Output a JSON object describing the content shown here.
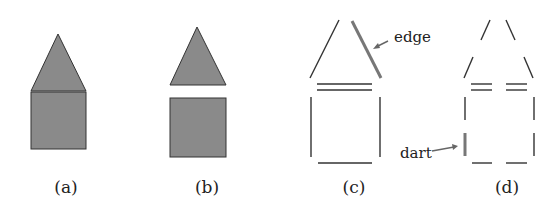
{
  "figure": {
    "panels": [
      {
        "id": "a",
        "label": "(a)",
        "description": "filled house: triangle roof on square"
      },
      {
        "id": "b",
        "label": "(b)",
        "description": "separated filled triangle and square"
      },
      {
        "id": "c",
        "label": "(c)",
        "description": "edges of the shapes",
        "annotation": "edge"
      },
      {
        "id": "d",
        "label": "(d)",
        "description": "darts (half-edges)",
        "annotation": "dart"
      }
    ],
    "colors": {
      "fill": "#8a8a8a",
      "stroke": "#333333",
      "highlight": "#777777"
    }
  }
}
